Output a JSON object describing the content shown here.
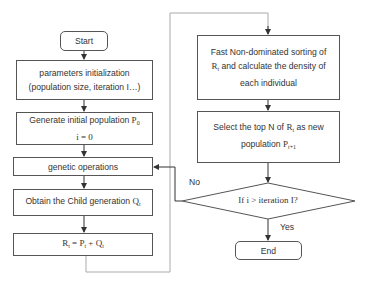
{
  "flowchart": {
    "start": {
      "label": "Start"
    },
    "params_init": {
      "line1": "parameters initialization",
      "line2": "(population size, iteration I…)"
    },
    "generate": {
      "line1": "Generate initial population",
      "var": "P",
      "sub": "0",
      "line2": "i = 0"
    },
    "genetic_ops": {
      "label": "genetic operations"
    },
    "obtain_child": {
      "label": "Obtain the Child generation",
      "var": "Q",
      "sub": "t"
    },
    "combine": {
      "lhs": "R",
      "lhs_sub": "t",
      "eq": " = ",
      "p": "P",
      "p_sub": "t",
      "plus": " + ",
      "q": "Q",
      "q_sub": "t"
    },
    "fast_sort": {
      "line1": "Fast Non-dominated sorting of",
      "var": "R",
      "sub": "t",
      "line2_rest": " and calculate the density of",
      "line3": "each individual"
    },
    "select": {
      "line1_pre": "Select the top N of",
      "var": "R",
      "sub": "t",
      "line1_post": " as new",
      "line2_pre": "population",
      "var2": "P",
      "sub2": "t+1"
    },
    "decision": {
      "label": "If i > iteration I?"
    },
    "end": {
      "label": "End"
    },
    "edge_labels": {
      "no": "No",
      "yes": "Yes"
    }
  },
  "colors": {
    "stroke": "#555555",
    "connector": "#aaaaaa",
    "text": "#333333",
    "background": "#ffffff"
  }
}
